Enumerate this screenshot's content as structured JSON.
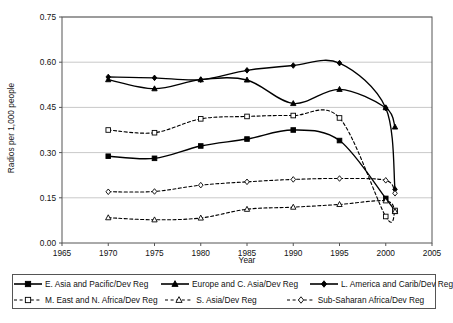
{
  "chart_data": {
    "type": "line",
    "title": "",
    "xlabel": "Year",
    "ylabel": "Radios per 1,000 people",
    "xlim": [
      1965,
      2005
    ],
    "ylim": [
      0.0,
      0.75
    ],
    "xticks": [
      1965,
      1970,
      1975,
      1980,
      1985,
      1990,
      1995,
      2000,
      2005
    ],
    "ytick_labels": [
      "0.00",
      "0.15",
      "0.30",
      "0.45",
      "0.60",
      "0.75"
    ],
    "yticks": [
      0.0,
      0.15,
      0.3,
      0.45,
      0.6,
      0.75
    ],
    "grid": "horizontal",
    "legend_position": "bottom",
    "x": [
      1970,
      1975,
      1980,
      1985,
      1990,
      1995,
      2000,
      2001
    ],
    "series": [
      {
        "name": "E. Asia and Pacific/Dev Reg",
        "marker": "filled-square",
        "line": "solid",
        "color": "#000000",
        "values": [
          0.288,
          0.281,
          0.322,
          0.345,
          0.375,
          0.34,
          0.148,
          0.105
        ]
      },
      {
        "name": "Europe and C. Asia/Dev Reg",
        "marker": "filled-triangle",
        "line": "solid",
        "color": "#000000",
        "values": [
          0.542,
          0.512,
          0.542,
          0.541,
          0.463,
          0.51,
          0.449,
          0.385
        ]
      },
      {
        "name": "L. America and Carib/Dev Reg",
        "marker": "filled-diamond",
        "line": "solid",
        "color": "#000000",
        "values": [
          0.551,
          0.548,
          0.542,
          0.573,
          0.589,
          0.597,
          0.448,
          0.178
        ]
      },
      {
        "name": "M. East and N. Africa/Dev Reg",
        "marker": "open-square",
        "line": "dotted",
        "color": "#000000",
        "values": [
          0.375,
          0.366,
          0.412,
          0.42,
          0.423,
          0.415,
          0.088,
          0.108
        ]
      },
      {
        "name": "S. Asia/Dev Reg",
        "marker": "open-triangle",
        "line": "dotted",
        "color": "#000000",
        "values": [
          0.084,
          0.077,
          0.083,
          0.112,
          0.119,
          0.128,
          0.14,
          0.105
        ]
      },
      {
        "name": "Sub-Saharan Africa/Dev Reg",
        "marker": "open-diamond",
        "line": "dotted",
        "color": "#000000",
        "values": [
          0.17,
          0.171,
          0.192,
          0.203,
          0.211,
          0.214,
          0.208,
          0.165
        ]
      }
    ]
  },
  "axes": {
    "y_title": "Radios per 1,000 people",
    "x_title": "Year",
    "y_labels": [
      "0.75",
      "0.60",
      "0.45",
      "0.30",
      "0.15",
      "0.00"
    ],
    "x_labels": [
      "1965",
      "1970",
      "1975",
      "1980",
      "1985",
      "1990",
      "1995",
      "2000",
      "2005"
    ]
  },
  "legend": {
    "row1": [
      {
        "label": "E. Asia and Pacific/Dev Reg",
        "marker": "filled-square",
        "line": "solid"
      },
      {
        "label": "Europe and C. Asia/Dev Reg",
        "marker": "filled-triangle",
        "line": "solid"
      },
      {
        "label": "L. America and Carib/Dev Reg",
        "marker": "filled-diamond",
        "line": "solid"
      }
    ],
    "row2": [
      {
        "label": "M. East and N. Africa/Dev Reg",
        "marker": "open-square",
        "line": "dotted"
      },
      {
        "label": "S. Asia/Dev Reg",
        "marker": "open-triangle",
        "line": "dotted"
      },
      {
        "label": "Sub-Saharan Africa/Dev Reg",
        "marker": "open-diamond",
        "line": "dotted"
      }
    ]
  },
  "colors": {
    "ink": "#000000",
    "grid": "#c9c9c9",
    "axis": "#555555",
    "background": "#ffffff"
  }
}
